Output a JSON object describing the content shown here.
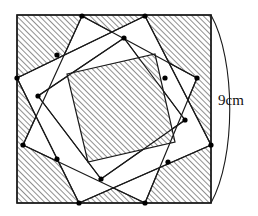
{
  "figure": {
    "shape_name": "square-with-inscribed-rotated-squares",
    "stroke_color": "#1a1a1a",
    "hatch_color": "#2b2b2b",
    "fill_color": "#ffffff",
    "dot_color": "#000000",
    "hatch_angle_deg": 45,
    "hatch_spacing_px": 4,
    "outer_square": {
      "name": "outer-square",
      "x": 17,
      "y": 15,
      "width": 194,
      "height": 188,
      "corners": [
        [
          17,
          15
        ],
        [
          211,
          15
        ],
        [
          211,
          203
        ],
        [
          17,
          203
        ]
      ],
      "hatched": true
    },
    "square_b": {
      "name": "rotated-square-b",
      "vertices": [
        [
          82,
          16
        ],
        [
          197,
          78
        ],
        [
          145,
          203
        ],
        [
          23,
          145
        ]
      ],
      "hatched": false
    },
    "square_c": {
      "name": "rotated-square-c",
      "vertices": [
        [
          124,
          38
        ],
        [
          185,
          120
        ],
        [
          101,
          179
        ],
        [
          38,
          96
        ]
      ],
      "hatched": false
    },
    "square_d": {
      "name": "rotated-square-d",
      "vertices": [
        [
          145,
          16
        ],
        [
          211,
          145
        ],
        [
          79,
          203
        ],
        [
          17,
          78
        ]
      ],
      "hatched": false
    },
    "inner_square": {
      "name": "inner-square",
      "vertices": [
        [
          67,
          74
        ],
        [
          155,
          54
        ],
        [
          175,
          142
        ],
        [
          88,
          162
        ]
      ],
      "hatched": true
    },
    "dots": [
      {
        "name": "dot-top-left-edge",
        "x": 82,
        "y": 16
      },
      {
        "name": "dot-top-right-edge",
        "x": 145,
        "y": 16
      },
      {
        "name": "dot-right-upper-edge",
        "x": 197,
        "y": 78
      },
      {
        "name": "dot-right-lower-edge",
        "x": 211,
        "y": 145
      },
      {
        "name": "dot-bottom-right-edge",
        "x": 145,
        "y": 203
      },
      {
        "name": "dot-bottom-left-edge",
        "x": 79,
        "y": 203
      },
      {
        "name": "dot-left-lower-edge",
        "x": 23,
        "y": 145
      },
      {
        "name": "dot-left-upper-edge",
        "x": 17,
        "y": 78
      },
      {
        "name": "dot-inner-top",
        "x": 124,
        "y": 38
      },
      {
        "name": "dot-inner-right",
        "x": 185,
        "y": 120
      },
      {
        "name": "dot-inner-bottom",
        "x": 101,
        "y": 179
      },
      {
        "name": "dot-inner-left",
        "x": 38,
        "y": 96
      },
      {
        "name": "dot-mid-upper-left",
        "x": 57,
        "y": 55
      },
      {
        "name": "dot-mid-upper-right",
        "x": 165,
        "y": 78
      },
      {
        "name": "dot-mid-lower-right",
        "x": 168,
        "y": 162
      },
      {
        "name": "dot-mid-lower-left",
        "x": 57,
        "y": 159
      }
    ],
    "dimension": {
      "name": "dimension-9cm",
      "label": "9cm",
      "label_x": 221,
      "label_y": 100,
      "arc": {
        "start": [
          211,
          15
        ],
        "end": [
          211,
          203
        ],
        "bulge_x": 238
      }
    }
  }
}
